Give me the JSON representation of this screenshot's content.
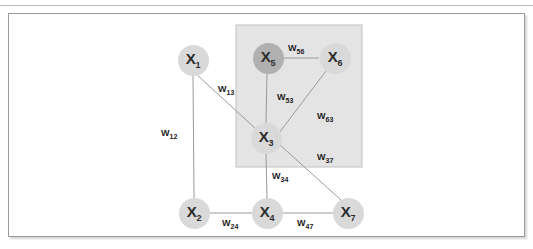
{
  "diagram": {
    "title_text": "",
    "background": "#ffffff",
    "frame": {
      "border_color": "#9b9b9b"
    },
    "highlight_box": {
      "name": "shaded-subgraph-region",
      "fill": "#e4e4e4",
      "border_color": "#c2c2c2",
      "x": 236,
      "y": 25,
      "width": 126,
      "height": 142
    },
    "node_style": {
      "fill_light": "#d9d9d9",
      "fill_dark": "#b0b0b0",
      "radius": 15.5
    },
    "edge_style": {
      "color": "#9a9a9a",
      "width": 1
    },
    "nodes": [
      {
        "id": "x1",
        "label": "X",
        "sub": "1",
        "cx": 193,
        "cy": 60,
        "shade": "light"
      },
      {
        "id": "x2",
        "label": "X",
        "sub": "2",
        "cx": 194,
        "cy": 213,
        "shade": "light"
      },
      {
        "id": "x3",
        "label": "X",
        "sub": "3",
        "cx": 266,
        "cy": 138,
        "shade": "light"
      },
      {
        "id": "x4",
        "label": "X",
        "sub": "4",
        "cx": 267,
        "cy": 213,
        "shade": "light"
      },
      {
        "id": "x5",
        "label": "X",
        "sub": "5",
        "cx": 268,
        "cy": 58,
        "shade": "dark"
      },
      {
        "id": "x6",
        "label": "X",
        "sub": "6",
        "cx": 335,
        "cy": 58,
        "shade": "light"
      },
      {
        "id": "x7",
        "label": "X",
        "sub": "7",
        "cx": 348,
        "cy": 213,
        "shade": "light"
      }
    ],
    "edges": [
      {
        "id": "e12",
        "from": "x1",
        "to": "x2",
        "x1": 193,
        "y1": 75,
        "x2": 194,
        "y2": 198
      },
      {
        "id": "e13",
        "from": "x1",
        "to": "x3",
        "x1": 196,
        "y1": 74,
        "x2": 256,
        "y2": 129
      },
      {
        "id": "e53",
        "from": "x5",
        "to": "x3",
        "x1": 267,
        "y1": 74,
        "x2": 266,
        "y2": 123
      },
      {
        "id": "e56",
        "from": "x5",
        "to": "x6",
        "x1": 284,
        "y1": 58,
        "x2": 319,
        "y2": 58
      },
      {
        "id": "e63",
        "from": "x6",
        "to": "x3",
        "x1": 326,
        "y1": 71,
        "x2": 279,
        "y2": 133
      },
      {
        "id": "e37",
        "from": "x3",
        "to": "x7",
        "x1": 279,
        "y1": 144,
        "x2": 341,
        "y2": 200
      },
      {
        "id": "e34",
        "from": "x3",
        "to": "x4",
        "x1": 266,
        "y1": 153,
        "x2": 267,
        "y2": 198
      },
      {
        "id": "e24",
        "from": "x2",
        "to": "x4",
        "x1": 210,
        "y1": 213,
        "x2": 252,
        "y2": 213
      },
      {
        "id": "e47",
        "from": "x4",
        "to": "x7",
        "x1": 283,
        "y1": 213,
        "x2": 333,
        "y2": 213
      }
    ],
    "weight_labels": [
      {
        "id": "w12",
        "label": "W",
        "sub": "12",
        "x": 161,
        "y": 129
      },
      {
        "id": "w13",
        "label": "W",
        "sub": "13",
        "x": 218,
        "y": 85
      },
      {
        "id": "w53",
        "label": "W",
        "sub": "53",
        "x": 277,
        "y": 93
      },
      {
        "id": "w56",
        "label": "W",
        "sub": "56",
        "x": 288,
        "y": 44
      },
      {
        "id": "w63",
        "label": "W",
        "sub": "63",
        "x": 317,
        "y": 112
      },
      {
        "id": "w37",
        "label": "W",
        "sub": "37",
        "x": 317,
        "y": 153
      },
      {
        "id": "w34",
        "label": "W",
        "sub": "34",
        "x": 272,
        "y": 172
      },
      {
        "id": "w24",
        "label": "W",
        "sub": "24",
        "x": 222,
        "y": 219
      },
      {
        "id": "w47",
        "label": "W",
        "sub": "47",
        "x": 297,
        "y": 219
      }
    ]
  }
}
